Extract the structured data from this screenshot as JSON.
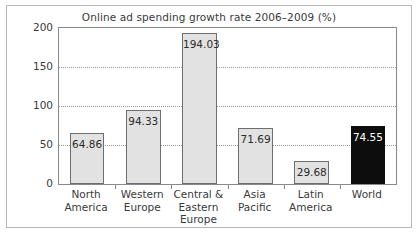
{
  "chart_data": {
    "type": "bar",
    "title": "Online ad spending growth rate 2006–2009 (%)",
    "xlabel": "",
    "ylabel": "",
    "ylim": [
      0,
      200
    ],
    "yticks": [
      0,
      50,
      100,
      150,
      200
    ],
    "ytick_labels": [
      "0",
      "50",
      "100",
      "150",
      "200"
    ],
    "grid": true,
    "grid_axis": "y",
    "grid_style": "dotted",
    "legend": "none",
    "categories": [
      "North America",
      "Western Europe",
      "Central & Eastern Europe",
      "Asia Pacific",
      "Latin America",
      "World"
    ],
    "category_lines": [
      [
        "North",
        "America"
      ],
      [
        "Western",
        "Europe"
      ],
      [
        "Central &",
        "Eastern",
        "Europe"
      ],
      [
        "Asia",
        "Pacific"
      ],
      [
        "Latin",
        "America"
      ],
      [
        "World"
      ]
    ],
    "values": [
      64.86,
      94.33,
      194.03,
      71.69,
      29.68,
      74.55
    ],
    "value_labels": [
      "64.86",
      "94.33",
      "194.03",
      "71.69",
      "29.68",
      "74.55"
    ],
    "bar_colors": [
      "#e2e2e2",
      "#e2e2e2",
      "#e2e2e2",
      "#e2e2e2",
      "#e2e2e2",
      "#0d0d0d"
    ],
    "bar_edge_colors": [
      "#6e6e6e",
      "#6e6e6e",
      "#6e6e6e",
      "#6e6e6e",
      "#6e6e6e",
      "#0d0d0d"
    ],
    "value_label_colors": [
      "#2b2b2b",
      "#2b2b2b",
      "#2b2b2b",
      "#2b2b2b",
      "#2b2b2b",
      "#ffffff"
    ],
    "highlight_category": "World"
  },
  "figure": {
    "border_color": "#b9b9b9",
    "axes_color": "#8a8a8a",
    "background": "#ffffff",
    "text_color": "#3a3a3a"
  }
}
